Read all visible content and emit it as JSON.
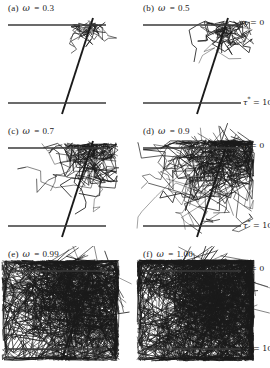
{
  "figure": {
    "type": "multi-panel-trajectory-plot",
    "rows": 3,
    "cols": 2,
    "background_color": "#ffffff",
    "ink_color": "#1a1a1a",
    "boundary_color": "#3a3a3a"
  },
  "axis_labels": {
    "top_boundary": "τ = 0",
    "bottom_boundary_symbol": "τ",
    "bottom_boundary_sup": "*",
    "bottom_boundary_value": " = 10",
    "bottom_boundary_full": "τ* = 10"
  },
  "panels": [
    {
      "id": "a",
      "index_label": "(a)",
      "omega_symbol": "ω",
      "equals": "=",
      "omega_value": "0.3",
      "label_full": "(a)  ω̃ = 0.3",
      "show_tau_labels": false,
      "scatter_density": 1,
      "seed": 11,
      "spread_x": 16,
      "spread_y": 11,
      "cluster_cx": 92,
      "cluster_cy": 30,
      "escape_depth": 0.12,
      "n_paths": 26,
      "steps_min": 2,
      "steps_max": 5
    },
    {
      "id": "b",
      "index_label": "(b)",
      "omega_symbol": "ω",
      "equals": "=",
      "omega_value": "0.5",
      "label_full": "(b)  ω̃ = 0.5",
      "show_tau_labels": true,
      "scatter_density": 2,
      "seed": 23,
      "spread_x": 22,
      "spread_y": 16,
      "cluster_cx": 90,
      "cluster_cy": 32,
      "escape_depth": 0.22,
      "n_paths": 40,
      "steps_min": 2,
      "steps_max": 7
    },
    {
      "id": "c",
      "index_label": "(c)",
      "omega_symbol": "ω",
      "equals": "=",
      "omega_value": "0.7",
      "label_full": "(c)  ω̃ = 0.7",
      "show_tau_labels": false,
      "scatter_density": 3,
      "seed": 37,
      "spread_x": 27,
      "spread_y": 21,
      "cluster_cx": 88,
      "cluster_cy": 33,
      "escape_depth": 0.34,
      "n_paths": 62,
      "steps_min": 3,
      "steps_max": 9
    },
    {
      "id": "d",
      "index_label": "(d)",
      "omega_symbol": "ω",
      "equals": "=",
      "omega_value": "0.9",
      "label_full": "(d)  ω̃ = 0.9",
      "show_tau_labels": true,
      "scatter_density": 5,
      "seed": 53,
      "spread_x": 36,
      "spread_y": 34,
      "cluster_cx": 85,
      "cluster_cy": 36,
      "escape_depth": 0.62,
      "n_paths": 105,
      "steps_min": 4,
      "steps_max": 13
    },
    {
      "id": "e",
      "index_label": "(e)",
      "omega_symbol": "ω",
      "equals": "=",
      "omega_value": "0.99",
      "label_full": "(e)  ω̃ = 0.99",
      "show_tau_labels": false,
      "scatter_density": 8,
      "seed": 71,
      "spread_x": 56,
      "spread_y": 50,
      "cluster_cx": 78,
      "cluster_cy": 46,
      "escape_depth": 0.95,
      "n_paths": 230,
      "steps_min": 5,
      "steps_max": 17
    },
    {
      "id": "f",
      "index_label": "(f)",
      "omega_symbol": "ω",
      "equals": "=",
      "omega_value": "1.00",
      "label_full": "(f)  ω̃ = 1.00",
      "show_tau_labels": true,
      "scatter_density": 9,
      "seed": 89,
      "spread_x": 60,
      "spread_y": 54,
      "cluster_cx": 76,
      "cluster_cy": 48,
      "escape_depth": 1.0,
      "n_paths": 270,
      "steps_min": 6,
      "steps_max": 19
    }
  ],
  "geometry": {
    "boundary_x_start": 8,
    "boundary_x_end": 106,
    "top_boundary_y": 25,
    "bottom_boundary_y": 103,
    "incident_ray_x_top": 93,
    "incident_ray_y_top": 18,
    "incident_ray_x_bottom": 62,
    "incident_ray_y_bottom": 114,
    "boundary_stroke_width": 1.6,
    "incident_stroke_width": 1.9,
    "path_stroke_width": 0.55
  }
}
